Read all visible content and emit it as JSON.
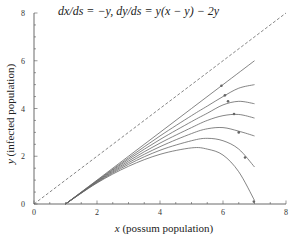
{
  "chart_data": {
    "type": "line",
    "title": "dx/ds = −y,    dy/ds = y(x − y) − 2y",
    "xlabel_var": "x",
    "xlabel_text": " (possum population)",
    "ylabel_var": "y",
    "ylabel_text": " (infected population)",
    "xlim": [
      0,
      8
    ],
    "ylim": [
      0,
      8
    ],
    "xticks_major": [
      0,
      2,
      4,
      6,
      8
    ],
    "yticks_major": [
      0,
      2,
      4,
      6,
      8
    ],
    "minor_tick_step": 0.5,
    "grid": false,
    "legend": null,
    "reference_line": {
      "name": "y = x",
      "style": "dashed",
      "points": [
        [
          0,
          0
        ],
        [
          8,
          8
        ]
      ]
    },
    "series": [
      {
        "name": "trajectory-1",
        "points": [
          [
            1.0,
            0.0
          ],
          [
            2.0,
            1.0
          ],
          [
            3.0,
            2.0
          ],
          [
            4.0,
            3.0
          ],
          [
            5.0,
            4.0
          ],
          [
            6.0,
            5.0
          ],
          [
            7.0,
            6.0
          ]
        ],
        "marker": [
          5.95,
          4.95
        ]
      },
      {
        "name": "trajectory-2",
        "points": [
          [
            1.0,
            0.0
          ],
          [
            2.0,
            0.98
          ],
          [
            3.0,
            1.93
          ],
          [
            4.0,
            2.85
          ],
          [
            5.0,
            3.7
          ],
          [
            5.5,
            4.1
          ],
          [
            6.0,
            4.5
          ],
          [
            6.5,
            4.85
          ],
          [
            7.0,
            5.0
          ]
        ],
        "marker": [
          6.06,
          4.55
        ]
      },
      {
        "name": "trajectory-3",
        "points": [
          [
            1.0,
            0.0
          ],
          [
            2.0,
            0.96
          ],
          [
            3.0,
            1.87
          ],
          [
            4.0,
            2.7
          ],
          [
            5.0,
            3.45
          ],
          [
            5.5,
            3.8
          ],
          [
            6.0,
            4.15
          ],
          [
            6.5,
            4.3
          ],
          [
            7.0,
            4.2
          ]
        ],
        "marker": [
          6.16,
          4.3
        ]
      },
      {
        "name": "trajectory-4",
        "points": [
          [
            1.0,
            0.0
          ],
          [
            2.0,
            0.94
          ],
          [
            3.0,
            1.8
          ],
          [
            4.0,
            2.55
          ],
          [
            5.0,
            3.2
          ],
          [
            5.5,
            3.5
          ],
          [
            6.0,
            3.7
          ],
          [
            6.5,
            3.75
          ],
          [
            7.0,
            3.6
          ]
        ],
        "marker": [
          6.35,
          3.77
        ]
      },
      {
        "name": "trajectory-5",
        "points": [
          [
            1.0,
            0.0
          ],
          [
            2.0,
            0.92
          ],
          [
            3.0,
            1.73
          ],
          [
            4.0,
            2.4
          ],
          [
            5.0,
            2.95
          ],
          [
            5.5,
            3.15
          ],
          [
            6.0,
            3.2
          ],
          [
            6.5,
            3.05
          ],
          [
            7.0,
            2.85
          ]
        ],
        "marker": [
          6.5,
          3.0
        ]
      },
      {
        "name": "trajectory-6",
        "points": [
          [
            1.0,
            0.0
          ],
          [
            2.0,
            0.9
          ],
          [
            3.0,
            1.66
          ],
          [
            4.0,
            2.25
          ],
          [
            5.0,
            2.65
          ],
          [
            5.5,
            2.75
          ],
          [
            6.0,
            2.65
          ],
          [
            6.5,
            2.3
          ],
          [
            7.0,
            1.55
          ]
        ],
        "marker": [
          6.7,
          1.95
        ]
      },
      {
        "name": "trajectory-7",
        "points": [
          [
            1.0,
            0.0
          ],
          [
            2.0,
            0.88
          ],
          [
            3.0,
            1.58
          ],
          [
            4.0,
            2.08
          ],
          [
            5.0,
            2.35
          ],
          [
            5.5,
            2.3
          ],
          [
            6.0,
            2.05
          ],
          [
            6.5,
            1.35
          ],
          [
            7.0,
            0.15
          ]
        ],
        "marker": [
          6.98,
          0.1
        ]
      }
    ]
  }
}
